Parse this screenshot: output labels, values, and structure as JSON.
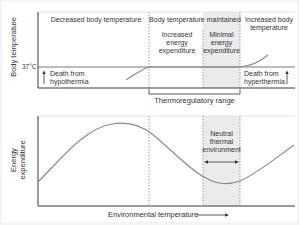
{
  "figure": {
    "top_panel": {
      "y_axis_label": "Body temperature",
      "tick_37": "37°C",
      "regions": {
        "decreased": "Decreased body temperature",
        "maintained": "Body temperature maintained",
        "increased": "Increased body temperature",
        "increased_energy": "Increased energy expenditure",
        "minimal_energy": "Minimal energy expenditure"
      },
      "death_hypothermia": "Death from hypothermia",
      "death_hyperthermia": "Death from hyperthermia",
      "range_label": "Thermoregulatory range"
    },
    "bottom_panel": {
      "y_axis_label_line1": "Energy",
      "y_axis_label_line2": "expenditure",
      "neutral_label": "Neutral thermal environment",
      "x_axis_label": "Environmental temperature"
    },
    "colors": {
      "curve": "#8a8a8a",
      "axis": "#3a3a3a",
      "shade": "#e9e9e9",
      "dashed": "#777777",
      "background_border": "#f4f4f4"
    }
  }
}
